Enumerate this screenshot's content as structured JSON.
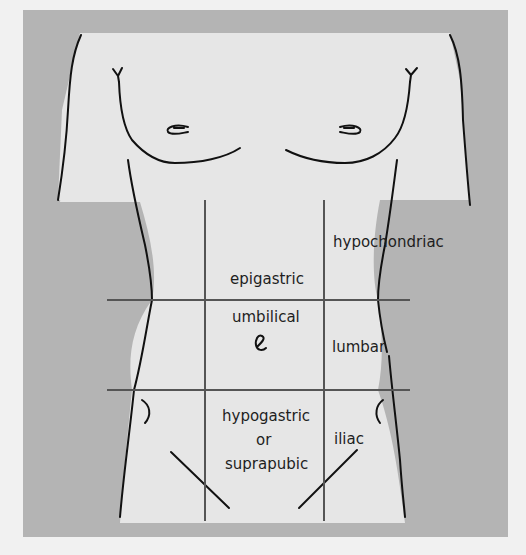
{
  "diagram": {
    "colors": {
      "page_background": "#f1f1f1",
      "frame_background": "#b4b4b4",
      "body_fill": "#e6e6e6",
      "outline": "#111111",
      "grid_lines": "#555555",
      "label_text": "#1e1e1e"
    },
    "regions": {
      "hypochondriac": "hypochondriac",
      "epigastric": "epigastric",
      "umbilical": "umbilical",
      "lumbar": "lumbar",
      "hypogastric_line1": "hypogastric",
      "hypogastric_line2": "or",
      "hypogastric_line3": "suprapubic",
      "iliac": "iliac"
    }
  }
}
